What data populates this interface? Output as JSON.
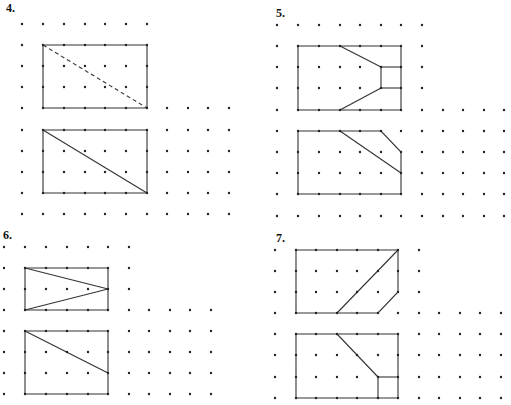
{
  "problems": [
    {
      "number": "4.",
      "ink": "#333333",
      "grid": {
        "cols": [
          22,
          43,
          64,
          85,
          105,
          126,
          147,
          167,
          188,
          208,
          229
        ],
        "rows": [
          24,
          45,
          66,
          87,
          108,
          130,
          151,
          172,
          193,
          214
        ],
        "narrow_rows": 4,
        "narrow_cols": 7
      },
      "figures": [
        {
          "name": "top-rectangle",
          "polygon": [
            [
              1,
              1
            ],
            [
              6,
              1
            ],
            [
              6,
              4
            ],
            [
              1,
              4
            ]
          ],
          "segments": [
            {
              "from": [
                1,
                1
              ],
              "to": [
                6,
                4
              ],
              "style": "dashed"
            }
          ]
        },
        {
          "name": "bottom-rectangle",
          "polygon": [
            [
              1,
              5
            ],
            [
              6,
              5
            ],
            [
              6,
              8
            ],
            [
              1,
              8
            ]
          ],
          "segments": [
            {
              "from": [
                1,
                5
              ],
              "to": [
                6,
                8
              ],
              "style": "solid"
            }
          ]
        }
      ]
    },
    {
      "number": "5.",
      "ink": "#333333",
      "grid": {
        "cols": [
          277,
          298,
          319,
          340,
          360,
          381,
          401,
          422,
          443,
          463,
          484,
          504
        ],
        "rows": [
          25,
          46,
          67,
          88,
          110,
          131,
          152,
          173,
          194,
          216
        ],
        "narrow_rows": 4,
        "narrow_cols": 8
      },
      "figures": [
        {
          "name": "top-figure",
          "polygon": [
            [
              1,
              1
            ],
            [
              6,
              1
            ],
            [
              6,
              4
            ],
            [
              1,
              4
            ]
          ],
          "segments": [
            {
              "from": [
                3,
                1
              ],
              "to": [
                5,
                2
              ],
              "style": "solid"
            },
            {
              "from": [
                5,
                2
              ],
              "to": [
                6,
                2
              ],
              "style": "solid"
            },
            {
              "from": [
                5,
                2
              ],
              "to": [
                5,
                3
              ],
              "style": "solid"
            },
            {
              "from": [
                5,
                3
              ],
              "to": [
                6,
                3
              ],
              "style": "solid"
            },
            {
              "from": [
                5,
                3
              ],
              "to": [
                3,
                4
              ],
              "style": "solid"
            }
          ]
        },
        {
          "name": "bottom-figure",
          "polygon": [
            [
              1,
              5
            ],
            [
              5,
              5
            ],
            [
              6,
              6
            ],
            [
              6,
              8
            ],
            [
              1,
              8
            ]
          ],
          "segments": [
            {
              "from": [
                3,
                5
              ],
              "to": [
                6,
                7
              ],
              "style": "solid"
            }
          ]
        }
      ]
    },
    {
      "number": "6.",
      "ink": "#333333",
      "grid": {
        "cols": [
          4,
          25,
          46,
          67,
          88,
          108,
          129,
          149,
          170,
          190,
          211
        ],
        "rows": [
          247,
          268,
          289,
          310,
          331,
          352,
          373,
          394
        ],
        "narrow_rows": 3,
        "narrow_cols": 7
      },
      "figures": [
        {
          "name": "top-rectangle",
          "polygon": [
            [
              1,
              1
            ],
            [
              5,
              1
            ],
            [
              5,
              3
            ],
            [
              1,
              3
            ]
          ],
          "segments": [
            {
              "from": [
                1,
                1
              ],
              "to": [
                5,
                2
              ],
              "style": "solid"
            },
            {
              "from": [
                1,
                3
              ],
              "to": [
                5,
                2
              ],
              "style": "solid"
            }
          ]
        },
        {
          "name": "bottom-rectangle",
          "polygon": [
            [
              1,
              4
            ],
            [
              5,
              4
            ],
            [
              5,
              7
            ],
            [
              1,
              7
            ]
          ],
          "segments": [
            {
              "from": [
                1,
                4
              ],
              "to": [
                5,
                6
              ],
              "style": "solid"
            }
          ]
        }
      ]
    },
    {
      "number": "7.",
      "ink": "#333333",
      "grid": {
        "cols": [
          275,
          296,
          316,
          337,
          357,
          378,
          398,
          419,
          439,
          460,
          480,
          501
        ],
        "rows": [
          250,
          271,
          292,
          313,
          334,
          355,
          377,
          398
        ],
        "narrow_rows": 3,
        "narrow_cols": 8
      },
      "figures": [
        {
          "name": "top-figure",
          "polygon": [
            [
              1,
              0
            ],
            [
              6,
              0
            ],
            [
              6,
              2
            ],
            [
              5,
              3
            ],
            [
              1,
              3
            ]
          ],
          "segments": [
            {
              "from": [
                3,
                3
              ],
              "to": [
                6,
                0
              ],
              "style": "solid"
            }
          ]
        },
        {
          "name": "bottom-figure",
          "polygon": [
            [
              1,
              4
            ],
            [
              6,
              4
            ],
            [
              6,
              7
            ],
            [
              1,
              7
            ]
          ],
          "segments": [
            {
              "from": [
                3,
                4
              ],
              "to": [
                5,
                6
              ],
              "style": "solid"
            },
            {
              "from": [
                5,
                6
              ],
              "to": [
                6,
                6
              ],
              "style": "solid"
            },
            {
              "from": [
                5,
                6
              ],
              "to": [
                5,
                7
              ],
              "style": "solid"
            }
          ]
        }
      ]
    }
  ]
}
